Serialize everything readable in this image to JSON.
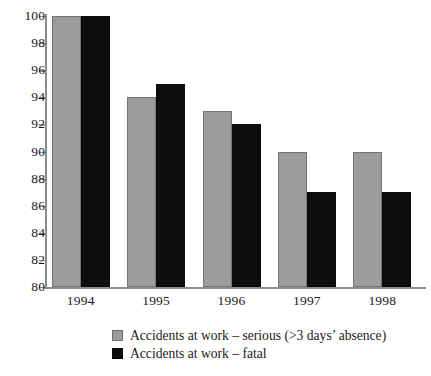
{
  "chart_data": {
    "type": "bar",
    "title": "",
    "subtitle": "",
    "xlabel": "",
    "ylabel": "",
    "categories": [
      "1994",
      "1995",
      "1996",
      "1997",
      "1998"
    ],
    "series": [
      {
        "name": "Accidents at work – serious (>3 days’ absence)",
        "color": "#9c9c9c",
        "values": [
          100,
          94,
          93,
          90,
          90
        ]
      },
      {
        "name": "Accidents at work – fatal",
        "color": "#0e0e0e",
        "values": [
          100,
          95,
          92,
          87,
          87
        ]
      }
    ],
    "ylim": [
      80,
      100
    ],
    "ytick_step": 2,
    "yticks": [
      80,
      82,
      84,
      86,
      88,
      90,
      92,
      94,
      96,
      98,
      100
    ],
    "ytick_labels": [
      "80",
      "82",
      "84",
      "86",
      "88",
      "90",
      "92",
      "94",
      "96",
      "98",
      "100"
    ],
    "grid": false,
    "legend_position": "bottom-center",
    "background": "#ffffff",
    "axis_color": "#8d8d8d"
  },
  "legend": {
    "entries": [
      {
        "label": "Accidents at work – serious (>3 days’ absence)"
      },
      {
        "label": "Accidents at work – fatal"
      }
    ]
  }
}
